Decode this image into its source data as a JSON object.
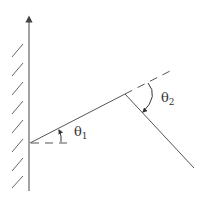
{
  "diagram": {
    "labels": {
      "theta1": {
        "symbol": "θ",
        "subscript": "1"
      },
      "theta2": {
        "symbol": "θ",
        "subscript": "2"
      }
    },
    "colors": {
      "stroke": "#555555",
      "text": "#333333",
      "background": "#ffffff"
    },
    "geometry": {
      "wall_axis": {
        "x": 29,
        "y_top": 15,
        "y_bottom": 191
      },
      "origin": {
        "x": 30,
        "y": 143
      },
      "vertex": {
        "x": 125,
        "y": 94
      },
      "incident_extension_end": {
        "x": 174,
        "y": 69
      },
      "reflected_end": {
        "x": 194,
        "y": 168
      },
      "horizontal_reference_end": {
        "x": 72,
        "y": 143
      },
      "hatch_count": 8
    }
  }
}
